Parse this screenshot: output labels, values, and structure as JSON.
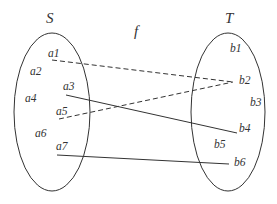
{
  "diagram": {
    "function_label": "f",
    "sets": [
      {
        "name": "S",
        "elements": [
          {
            "id": "a1",
            "label": "a1",
            "x": 48,
            "y": 57
          },
          {
            "id": "a2",
            "label": "a2",
            "x": 30,
            "y": 75
          },
          {
            "id": "a3",
            "label": "a3",
            "x": 63,
            "y": 90
          },
          {
            "id": "a4",
            "label": "a4",
            "x": 25,
            "y": 102
          },
          {
            "id": "a5",
            "label": "a5",
            "x": 56,
            "y": 115
          },
          {
            "id": "a6",
            "label": "a6",
            "x": 35,
            "y": 137
          },
          {
            "id": "a7",
            "label": "a7",
            "x": 56,
            "y": 150
          }
        ]
      },
      {
        "name": "T",
        "elements": [
          {
            "id": "b1",
            "label": "b1",
            "x": 230,
            "y": 52
          },
          {
            "id": "b2",
            "label": "b2",
            "x": 239,
            "y": 84
          },
          {
            "id": "b3",
            "label": "b3",
            "x": 250,
            "y": 106
          },
          {
            "id": "b4",
            "label": "b4",
            "x": 239,
            "y": 132
          },
          {
            "id": "b5",
            "label": "b5",
            "x": 214,
            "y": 148
          },
          {
            "id": "b6",
            "label": "b6",
            "x": 234,
            "y": 166
          }
        ]
      }
    ],
    "mappings": [
      {
        "from": "a1",
        "to": "b2",
        "style": "dashed"
      },
      {
        "from": "a5",
        "to": "b2",
        "style": "dashed"
      },
      {
        "from": "a3",
        "to": "b4",
        "style": "solid"
      },
      {
        "from": "a7",
        "to": "b6",
        "style": "solid"
      }
    ],
    "colors": {
      "stroke": "#333333",
      "text": "#333333",
      "background": "#ffffff"
    }
  }
}
